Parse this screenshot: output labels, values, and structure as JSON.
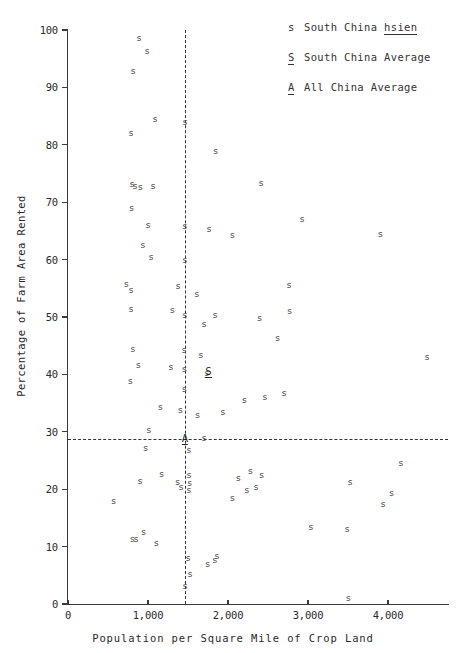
{
  "chart_data": {
    "type": "scatter",
    "title": "",
    "xlabel": "Population per Square Mile of Crop Land",
    "ylabel": "Percentage of Farm Area Rented",
    "xlim": [
      0,
      4750
    ],
    "ylim": [
      0,
      100
    ],
    "grid": false,
    "x_ticks": [
      0,
      1000,
      2000,
      3000,
      4000
    ],
    "x_tick_labels": [
      "0",
      "1,000",
      "2,000",
      "3,000",
      "4,000"
    ],
    "y_ticks": [
      0,
      10,
      20,
      30,
      40,
      50,
      60,
      70,
      80,
      90,
      100
    ],
    "y_tick_labels": [
      "0-",
      "10-",
      "20-",
      "30-",
      "40-",
      "50-",
      "60-",
      "70-",
      "80-",
      "90-",
      "100-"
    ],
    "legend_position": "top-right",
    "legend": [
      {
        "key": "s",
        "key_underlined": false,
        "label_plain": "South China ",
        "label_underlined": "hsien"
      },
      {
        "key": "S",
        "key_underlined": true,
        "label_plain": "South China Average",
        "label_underlined": ""
      },
      {
        "key": "A",
        "key_underlined": true,
        "label_plain": "All China Average",
        "label_underlined": ""
      }
    ],
    "reference_lines": [
      {
        "name": "all-china-average-horizontal",
        "orientation": "horizontal",
        "value": 28.8,
        "style": "dashed"
      },
      {
        "name": "all-china-average-vertical",
        "orientation": "vertical",
        "value": 1460,
        "style": "dashed"
      }
    ],
    "series": [
      {
        "name": "South China hsien",
        "marker": "s",
        "points": [
          [
            890,
            98.6
          ],
          [
            990,
            96.4
          ],
          [
            815,
            92.8
          ],
          [
            1090,
            84.5
          ],
          [
            1465,
            84.0
          ],
          [
            790,
            82.0
          ],
          [
            1845,
            78.9
          ],
          [
            800,
            73.2
          ],
          [
            840,
            72.8
          ],
          [
            905,
            72.6
          ],
          [
            1065,
            72.9
          ],
          [
            2415,
            73.4
          ],
          [
            795,
            69.0
          ],
          [
            1000,
            66.1
          ],
          [
            1460,
            65.9
          ],
          [
            1765,
            65.4
          ],
          [
            2055,
            64.2
          ],
          [
            2925,
            67.0
          ],
          [
            3905,
            64.4
          ],
          [
            935,
            62.5
          ],
          [
            1040,
            60.5
          ],
          [
            1460,
            60.0
          ],
          [
            730,
            55.8
          ],
          [
            790,
            54.7
          ],
          [
            1375,
            55.4
          ],
          [
            1610,
            54.0
          ],
          [
            2765,
            55.5
          ],
          [
            790,
            51.4
          ],
          [
            1305,
            51.2
          ],
          [
            1460,
            50.4
          ],
          [
            1700,
            48.8
          ],
          [
            1840,
            50.3
          ],
          [
            2395,
            49.9
          ],
          [
            2770,
            51.0
          ],
          [
            2620,
            46.4
          ],
          [
            4490,
            43.0
          ],
          [
            810,
            44.5
          ],
          [
            1450,
            44.2
          ],
          [
            1660,
            43.4
          ],
          [
            880,
            41.6
          ],
          [
            1285,
            41.3
          ],
          [
            1455,
            41.0
          ],
          [
            1735,
            40.2
          ],
          [
            780,
            38.8
          ],
          [
            1455,
            37.5
          ],
          [
            2460,
            36.0
          ],
          [
            2700,
            36.8
          ],
          [
            1155,
            34.3
          ],
          [
            1405,
            33.8
          ],
          [
            1620,
            33.0
          ],
          [
            1935,
            33.5
          ],
          [
            2205,
            35.5
          ],
          [
            1010,
            30.3
          ],
          [
            1700,
            29.0
          ],
          [
            970,
            27.2
          ],
          [
            1510,
            26.9
          ],
          [
            4160,
            24.6
          ],
          [
            1170,
            22.6
          ],
          [
            2130,
            22.0
          ],
          [
            2280,
            23.2
          ],
          [
            2420,
            22.5
          ],
          [
            1515,
            22.4
          ],
          [
            1520,
            21.0
          ],
          [
            900,
            21.5
          ],
          [
            1370,
            21.2
          ],
          [
            1415,
            20.4
          ],
          [
            1510,
            19.8
          ],
          [
            2235,
            19.9
          ],
          [
            2350,
            20.3
          ],
          [
            3525,
            21.2
          ],
          [
            4045,
            19.3
          ],
          [
            570,
            17.9
          ],
          [
            2055,
            18.4
          ],
          [
            3940,
            17.5
          ],
          [
            3035,
            13.5
          ],
          [
            3490,
            13.0
          ],
          [
            805,
            11.4
          ],
          [
            850,
            11.3
          ],
          [
            945,
            12.6
          ],
          [
            1105,
            10.6
          ],
          [
            1500,
            8.0
          ],
          [
            1745,
            7.0
          ],
          [
            1835,
            7.6
          ],
          [
            1860,
            8.3
          ],
          [
            1525,
            5.2
          ],
          [
            1465,
            3.2
          ],
          [
            3505,
            1.0
          ]
        ]
      },
      {
        "name": "South China Average",
        "marker": "S",
        "underlined": true,
        "points": [
          [
            1755,
            40.5
          ]
        ]
      },
      {
        "name": "All China Average",
        "marker": "A",
        "underlined": true,
        "points": [
          [
            1460,
            28.8
          ]
        ]
      }
    ]
  }
}
